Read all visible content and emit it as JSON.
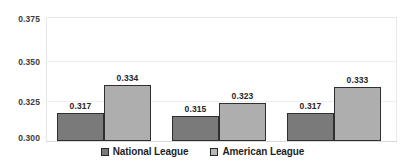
{
  "chart_data": {
    "type": "bar",
    "title": "",
    "xlabel": "",
    "ylabel": "",
    "ylim": [
      0.3,
      0.375
    ],
    "yticks": [
      "0.300",
      "0.325",
      "0.350",
      "0.375"
    ],
    "ytick_values": [
      0.3,
      0.325,
      0.35,
      0.375
    ],
    "grid": true,
    "legend_position": "bottom",
    "categories": [
      "Group 1",
      "Group 2",
      "Group 3"
    ],
    "series": [
      {
        "name": "National League",
        "color": "#7a7a7a",
        "values": [
          0.317,
          0.315,
          0.317
        ],
        "labels": [
          "0.317",
          "0.315",
          "0.317"
        ]
      },
      {
        "name": "American League",
        "color": "#aeaeae",
        "values": [
          0.334,
          0.323,
          0.333
        ],
        "labels": [
          "0.334",
          "0.323",
          "0.333"
        ]
      }
    ]
  },
  "legend": {
    "items": [
      {
        "label": "National League",
        "swatch_icon": "legend-swatch-dark"
      },
      {
        "label": "American League",
        "swatch_icon": "legend-swatch-light"
      }
    ]
  }
}
